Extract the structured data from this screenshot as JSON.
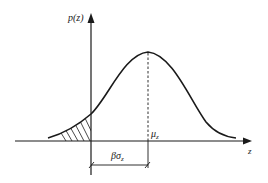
{
  "diagram": {
    "y_axis_label": "p(z)",
    "x_axis_label": "z",
    "mean_label": "μ",
    "mean_subscript": "z",
    "distance_label_prefix": "βσ",
    "distance_label_subscript": "z",
    "shaded_region": "left tail (z < 0), hatched",
    "colors": {
      "line": "#1a1a1a",
      "background": "#ffffff"
    }
  }
}
